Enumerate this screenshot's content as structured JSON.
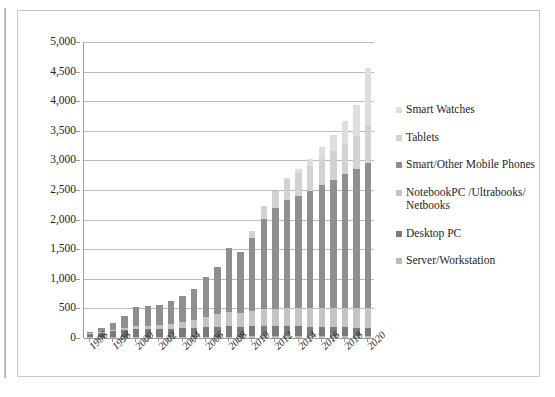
{
  "chart_data": {
    "type": "bar",
    "subtype": "stacked-bar",
    "title": "",
    "subtitle": "",
    "xlabel": "",
    "ylabel": "",
    "ylim": [
      0,
      5000
    ],
    "ytick_step": 500,
    "ytick_labels": [
      "5,000",
      "4,500",
      "4,000",
      "3,500",
      "3,000",
      "2,500",
      "2,000",
      "1,500",
      "1,000",
      "500",
      "0"
    ],
    "ytick_values": [
      5000,
      4500,
      4000,
      3500,
      3000,
      2500,
      2000,
      1500,
      1000,
      500,
      0
    ],
    "grid": true,
    "legend_position": "right",
    "categories": [
      "1996",
      "1997",
      "1998",
      "1999",
      "2000",
      "2001",
      "2002",
      "2003",
      "2004",
      "2005",
      "2006",
      "2007",
      "2008",
      "2009",
      "2010",
      "2011",
      "2012",
      "2013",
      "2014",
      "2015",
      "2016",
      "2017",
      "2018",
      "2019",
      "2020"
    ],
    "xtick_labels_shown": [
      "1996",
      "1998",
      "2000",
      "2002",
      "2004",
      "2006",
      "2008",
      "2010",
      "2012",
      "2014",
      "2016",
      "2018",
      "2020"
    ],
    "series": [
      {
        "name": "Server/Workstation",
        "color": "#b9b9b9",
        "values": [
          10,
          12,
          14,
          16,
          18,
          18,
          19,
          20,
          21,
          22,
          23,
          24,
          25,
          24,
          26,
          27,
          28,
          29,
          30,
          31,
          32,
          33,
          34,
          35,
          36
        ]
      },
      {
        "name": "Desktop PC",
        "color": "#7a7a7a",
        "values": [
          62,
          80,
          98,
          118,
          140,
          130,
          128,
          132,
          140,
          148,
          160,
          170,
          180,
          168,
          175,
          178,
          175,
          170,
          165,
          160,
          155,
          150,
          145,
          140,
          135
        ]
      },
      {
        "name": "NotebookPC /Ultrabooks/ Netbooks",
        "color": "#c4c4c4",
        "values": [
          5,
          10,
          18,
          30,
          52,
          60,
          70,
          85,
          110,
          140,
          175,
          210,
          240,
          230,
          260,
          280,
          295,
          300,
          305,
          310,
          315,
          320,
          325,
          330,
          335
        ]
      },
      {
        "name": "Smart/Other Mobile Phones",
        "color": "#8f8f8f",
        "values": [
          25,
          60,
          120,
          200,
          320,
          330,
          340,
          390,
          440,
          520,
          670,
          790,
          1070,
          1030,
          1230,
          1530,
          1690,
          1830,
          1900,
          1990,
          2080,
          2170,
          2260,
          2350,
          2450
        ]
      },
      {
        "name": "Tablets",
        "color": "#d2d2d2",
        "values": [
          0,
          0,
          0,
          0,
          0,
          0,
          0,
          0,
          0,
          0,
          0,
          0,
          0,
          0,
          120,
          220,
          300,
          350,
          390,
          420,
          450,
          480,
          510,
          560,
          640
        ]
      },
      {
        "name": "Smart Watches",
        "color": "#dedede",
        "values": [
          0,
          0,
          0,
          0,
          0,
          0,
          0,
          0,
          0,
          0,
          0,
          0,
          0,
          0,
          0,
          0,
          0,
          30,
          70,
          120,
          190,
          280,
          400,
          530,
          970
        ]
      }
    ],
    "totals": [
      102,
      162,
      250,
      364,
      530,
      538,
      557,
      627,
      711,
      830,
      1028,
      1194,
      1515,
      1452,
      1811,
      2235,
      2488,
      2709,
      2860,
      3031,
      3222,
      3433,
      3674,
      3945,
      4566
    ],
    "annotations": []
  },
  "legend": {
    "items": [
      {
        "label": "Smart Watches",
        "color": "#dedede"
      },
      {
        "label": "Tablets",
        "color": "#d2d2d2"
      },
      {
        "label": "Smart/Other Mobile Phones",
        "color": "#8f8f8f"
      },
      {
        "label": "NotebookPC /Ultrabooks/ Netbooks",
        "color": "#c4c4c4"
      },
      {
        "label": "Desktop PC",
        "color": "#7a7a7a"
      },
      {
        "label": "Server/Workstation",
        "color": "#b9b9b9"
      }
    ]
  },
  "colors": {
    "gridline": "#bcbcbc",
    "axis": "#9a9a9a",
    "frame": "#c9c9c9",
    "text": "#232323",
    "background": "#ffffff"
  }
}
